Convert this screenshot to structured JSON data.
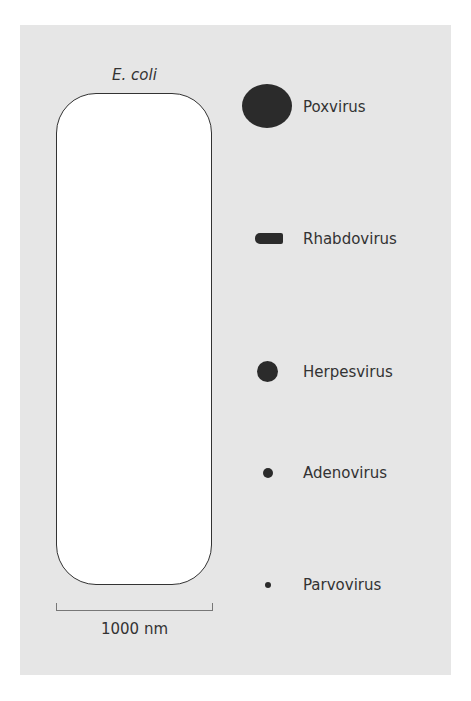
{
  "ecoli": {
    "label": "E. coli"
  },
  "scale_bar": {
    "label": "1000 nm"
  },
  "viruses": [
    {
      "name": "Poxvirus"
    },
    {
      "name": "Rhabdovirus"
    },
    {
      "name": "Herpesvirus"
    },
    {
      "name": "Adenovirus"
    },
    {
      "name": "Parvovirus"
    }
  ],
  "colors": {
    "background": "#e6e6e6",
    "virus": "#2b2b2b",
    "cell": "#ffffff"
  }
}
